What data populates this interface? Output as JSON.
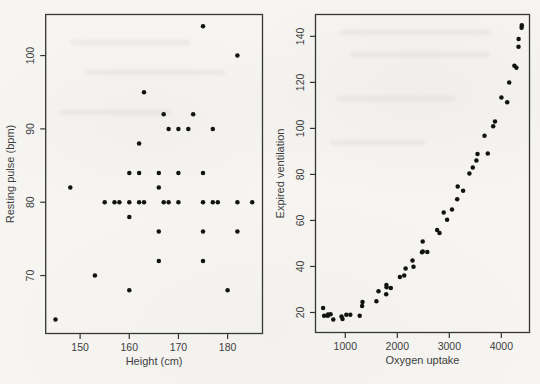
{
  "figure": {
    "background": "#f6f5f2",
    "axis_color": "#353535",
    "label_color": "#3d3d3d",
    "marker_color": "#121212"
  },
  "chart_data": [
    {
      "type": "scatter",
      "panel": "left",
      "title": "",
      "xlabel": "Height (cm)",
      "ylabel": "Resting pulse (bpm)",
      "xlim": [
        143.0,
        187.1
      ],
      "ylim": [
        62.1,
        105.6
      ],
      "xticks": [
        150,
        160,
        170,
        180
      ],
      "yticks": [
        70,
        80,
        90,
        100
      ],
      "grid": false,
      "marker": "filled-circle",
      "points": [
        [
          145,
          64
        ],
        [
          148,
          82
        ],
        [
          153,
          70
        ],
        [
          155,
          80
        ],
        [
          157,
          80
        ],
        [
          158,
          80
        ],
        [
          160,
          68
        ],
        [
          160,
          78
        ],
        [
          160,
          80
        ],
        [
          160,
          84
        ],
        [
          162,
          80
        ],
        [
          162,
          84
        ],
        [
          162,
          88
        ],
        [
          163,
          80
        ],
        [
          163,
          95
        ],
        [
          166,
          72
        ],
        [
          166,
          76
        ],
        [
          166,
          82
        ],
        [
          166,
          84
        ],
        [
          167,
          80
        ],
        [
          167,
          92
        ],
        [
          168,
          80
        ],
        [
          168,
          90
        ],
        [
          170,
          80
        ],
        [
          170,
          84
        ],
        [
          170,
          90
        ],
        [
          172,
          90
        ],
        [
          173,
          92
        ],
        [
          175,
          72
        ],
        [
          175,
          76
        ],
        [
          175,
          80
        ],
        [
          175,
          84
        ],
        [
          175,
          104
        ],
        [
          177,
          80
        ],
        [
          177,
          90
        ],
        [
          178,
          80
        ],
        [
          180,
          68
        ],
        [
          182,
          76
        ],
        [
          182,
          80
        ],
        [
          182,
          100
        ],
        [
          185,
          80
        ]
      ]
    },
    {
      "type": "scatter",
      "panel": "right",
      "title": "",
      "xlabel": "Oxygen uptake",
      "ylabel": "Expired ventilation",
      "xlim": [
        427,
        4542
      ],
      "ylim": [
        11.3,
        149.5
      ],
      "xticks": [
        1000,
        2000,
        3000,
        4000
      ],
      "yticks": [
        20,
        40,
        60,
        80,
        100,
        120,
        140
      ],
      "grid": false,
      "marker": "filled-circle",
      "points": [
        [
          574,
          21.9
        ],
        [
          592,
          18.6
        ],
        [
          664,
          18.6
        ],
        [
          667,
          19.1
        ],
        [
          718,
          19.2
        ],
        [
          770,
          16.9
        ],
        [
          927,
          18.3
        ],
        [
          947,
          17.2
        ],
        [
          1020,
          19.0
        ],
        [
          1096,
          19.0
        ],
        [
          1277,
          18.6
        ],
        [
          1323,
          22.8
        ],
        [
          1330,
          24.6
        ],
        [
          1599,
          24.9
        ],
        [
          1639,
          29.2
        ],
        [
          1787,
          27.9
        ],
        [
          1790,
          32.0
        ],
        [
          1794,
          31.0
        ],
        [
          1874,
          30.7
        ],
        [
          2049,
          35.4
        ],
        [
          2132,
          36.1
        ],
        [
          2160,
          39.1
        ],
        [
          2292,
          42.6
        ],
        [
          2312,
          39.9
        ],
        [
          2475,
          46.2
        ],
        [
          2489,
          50.9
        ],
        [
          2490,
          46.5
        ],
        [
          2577,
          46.3
        ],
        [
          2766,
          55.8
        ],
        [
          2812,
          54.5
        ],
        [
          2893,
          63.5
        ],
        [
          2957,
          60.3
        ],
        [
          3052,
          64.8
        ],
        [
          3151,
          69.2
        ],
        [
          3161,
          74.7
        ],
        [
          3266,
          72.9
        ],
        [
          3386,
          80.4
        ],
        [
          3452,
          83.0
        ],
        [
          3521,
          86.0
        ],
        [
          3543,
          88.9
        ],
        [
          3676,
          96.8
        ],
        [
          3741,
          89.1
        ],
        [
          3844,
          100.9
        ],
        [
          3878,
          103.0
        ],
        [
          4002,
          113.4
        ],
        [
          4114,
          111.4
        ],
        [
          4152,
          119.9
        ],
        [
          4252,
          127.2
        ],
        [
          4290,
          126.4
        ],
        [
          4331,
          135.5
        ],
        [
          4332,
          138.9
        ],
        [
          4390,
          143.7
        ],
        [
          4393,
          144.8
        ]
      ]
    }
  ]
}
